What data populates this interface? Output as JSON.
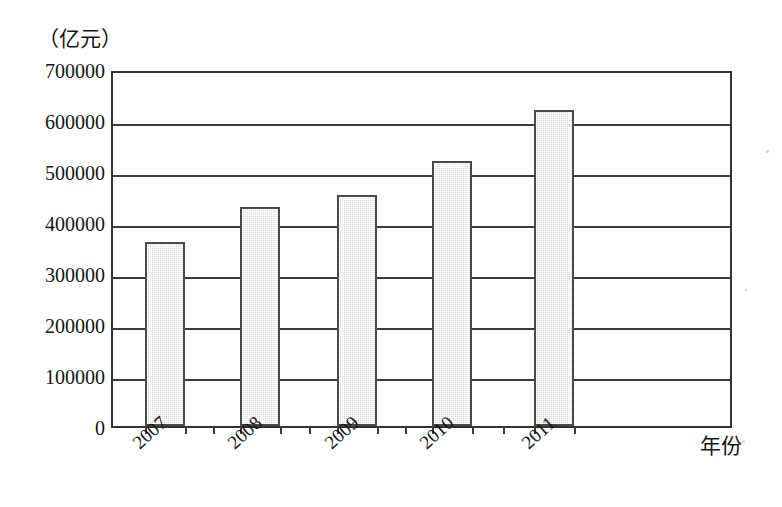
{
  "chart_data": {
    "type": "bar",
    "title": "",
    "subtitle": "",
    "xlabel": "年份",
    "ylabel": "（亿元）",
    "categories": [
      "2007",
      "2008",
      "2009",
      "2010",
      "2011"
    ],
    "values": [
      360000,
      430000,
      452000,
      520000,
      620000
    ],
    "series": [
      {
        "name": "",
        "values": [
          360000,
          430000,
          452000,
          520000,
          620000
        ]
      }
    ],
    "ylim": [
      0,
      700000
    ],
    "yticks": [
      0,
      100000,
      200000,
      300000,
      400000,
      500000,
      600000,
      700000
    ],
    "ytick_labels": [
      "0",
      "100000",
      "200000",
      "300000",
      "400000",
      "500000",
      "600000",
      "700000"
    ],
    "grid": true,
    "grid_axis": "y",
    "legend": false,
    "legend_position": "none",
    "bar_fill_color": "#dcdcdc",
    "bar_edge_color": "#4a4a4a",
    "axis_color": "#333333",
    "background_color": "#ffffff",
    "xtick_label_rotation": -42
  },
  "axis": {
    "y_unit_caption": "（亿元）",
    "x_axis_title": "年份"
  }
}
